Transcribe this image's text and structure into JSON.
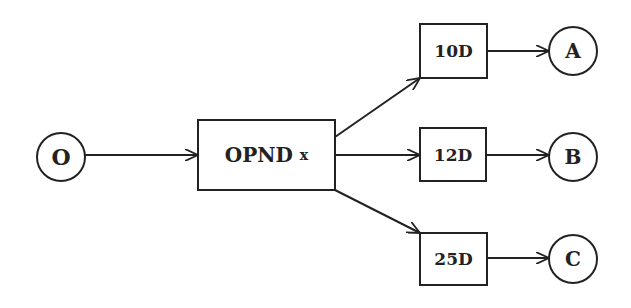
{
  "diagram": {
    "start_node": {
      "label": "O"
    },
    "op_node": {
      "label": "OPND",
      "suffix": "x"
    },
    "branches": [
      {
        "box": "10D",
        "end": "A"
      },
      {
        "box": "12D",
        "end": "B"
      },
      {
        "box": "25D",
        "end": "C"
      }
    ]
  }
}
